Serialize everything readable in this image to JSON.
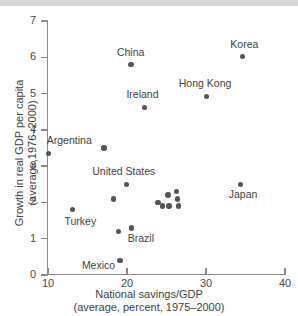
{
  "chart_data": {
    "type": "scatter",
    "title": "",
    "xlabel": "National savings/GDP",
    "xlabel_line2": "(average, percent, 1975–2000)",
    "ylabel": "Growth in real GDP per capita",
    "ylabel_line2": "(average,1976–2000)",
    "xlim": [
      10,
      40
    ],
    "ylim": [
      0,
      7
    ],
    "xticks": [
      10,
      20,
      30,
      40
    ],
    "yticks": [
      0,
      1,
      2,
      3,
      4,
      5,
      6,
      7
    ],
    "xtick_labels": [
      "10",
      "20",
      "30",
      "40"
    ],
    "ytick_labels": [
      "0",
      "1",
      "2",
      "3",
      "4",
      "5",
      "6",
      "7"
    ],
    "grid": false,
    "legend": "none",
    "marker_color": "#555555",
    "axis_color": "#8a8a8a",
    "points": [
      {
        "x": 10.1,
        "y": 3.35,
        "label": "Argentina",
        "label_dx": -2,
        "label_dy": -13,
        "label_align": "left"
      },
      {
        "x": 13.1,
        "y": 1.8,
        "label": "Turkey",
        "label_dx": -8,
        "label_dy": 11,
        "label_align": "left"
      },
      {
        "x": 17.1,
        "y": 3.5,
        "label": "",
        "label_dx": 0,
        "label_dy": 0,
        "label_align": "left"
      },
      {
        "x": 18.3,
        "y": 2.1,
        "label": "",
        "label_dx": 0,
        "label_dy": 0,
        "label_align": "left"
      },
      {
        "x": 18.9,
        "y": 1.2,
        "label": "",
        "label_dx": 0,
        "label_dy": 0,
        "label_align": "left"
      },
      {
        "x": 19.1,
        "y": 0.4,
        "label": "Mexico",
        "label_dx": -38,
        "label_dy": 5,
        "label_align": "left"
      },
      {
        "x": 19.9,
        "y": 2.5,
        "label": "United States",
        "label_dx": -34,
        "label_dy": -13,
        "label_align": "left"
      },
      {
        "x": 20.5,
        "y": 5.8,
        "label": "China",
        "label_dx": -14,
        "label_dy": -13,
        "label_align": "left"
      },
      {
        "x": 20.6,
        "y": 1.3,
        "label": "Brazil",
        "label_dx": -4,
        "label_dy": 10,
        "label_align": "left"
      },
      {
        "x": 22.2,
        "y": 4.62,
        "label": "Ireland",
        "label_dx": -18,
        "label_dy": -13,
        "label_align": "left"
      },
      {
        "x": 23.9,
        "y": 2.0,
        "label": "",
        "label_dx": 0,
        "label_dy": 0,
        "label_align": "left"
      },
      {
        "x": 24.5,
        "y": 1.9,
        "label": "",
        "label_dx": 0,
        "label_dy": 0,
        "label_align": "left"
      },
      {
        "x": 25.2,
        "y": 2.2,
        "label": "",
        "label_dx": 0,
        "label_dy": 0,
        "label_align": "left"
      },
      {
        "x": 25.3,
        "y": 1.9,
        "label": "",
        "label_dx": 0,
        "label_dy": 0,
        "label_align": "left"
      },
      {
        "x": 26.3,
        "y": 2.3,
        "label": "",
        "label_dx": 0,
        "label_dy": 0,
        "label_align": "left"
      },
      {
        "x": 26.4,
        "y": 2.1,
        "label": "",
        "label_dx": 0,
        "label_dy": 0,
        "label_align": "left"
      },
      {
        "x": 26.5,
        "y": 1.9,
        "label": "",
        "label_dx": 0,
        "label_dy": 0,
        "label_align": "left"
      },
      {
        "x": 30.1,
        "y": 4.92,
        "label": "Hong Kong",
        "label_dx": -28,
        "label_dy": -13,
        "label_align": "left"
      },
      {
        "x": 34.4,
        "y": 2.5,
        "label": "Japan",
        "label_dx": -12,
        "label_dy": 10,
        "label_align": "left"
      },
      {
        "x": 34.6,
        "y": 6.02,
        "label": "Korea",
        "label_dx": -12,
        "label_dy": -13,
        "label_align": "left"
      }
    ]
  }
}
